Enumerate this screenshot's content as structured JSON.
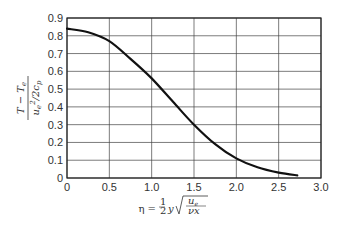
{
  "chart_data": {
    "type": "line",
    "title": "",
    "xlabel": "η = ½ y √(u_e / νx)",
    "ylabel": "(T − T_e) / (u_e²/2c_p)",
    "xlim": [
      0,
      3.0
    ],
    "ylim": [
      0,
      0.9
    ],
    "grid": true,
    "legend": null,
    "x_ticks": [
      "0",
      "0.5",
      "1.0",
      "1.5",
      "2.0",
      "2.5",
      "3.0"
    ],
    "y_ticks": [
      "0",
      "0.1",
      "0.2",
      "0.3",
      "0.4",
      "0.5",
      "0.6",
      "0.7",
      "0.8",
      "0.9"
    ],
    "series": [
      {
        "name": "temperature profile",
        "x": [
          0,
          0.25,
          0.5,
          0.75,
          1.0,
          1.25,
          1.5,
          1.75,
          2.0,
          2.25,
          2.5,
          2.72
        ],
        "y": [
          0.84,
          0.82,
          0.77,
          0.67,
          0.56,
          0.43,
          0.3,
          0.19,
          0.11,
          0.06,
          0.03,
          0.015
        ]
      }
    ]
  }
}
